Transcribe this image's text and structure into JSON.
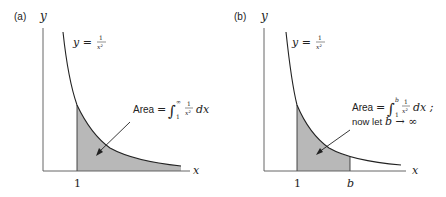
{
  "colors": {
    "stroke": "#222222",
    "shade": "#b8b8b8",
    "axis": "#444444"
  },
  "panels": [
    {
      "label": "(a)",
      "y_axis_label": "y",
      "x_axis_label": "x",
      "curve_label": {
        "lhs": "y =",
        "num": "1",
        "den": "x²"
      },
      "tick_labels": [
        "1"
      ],
      "annotation": {
        "area_word": "Area",
        "eq": "=",
        "integral": "∫",
        "upper": "∞",
        "lower": "1",
        "num": "1",
        "den": "x²",
        "dx": "dx"
      }
    },
    {
      "label": "(b)",
      "y_axis_label": "y",
      "x_axis_label": "x",
      "curve_label": {
        "lhs": "y =",
        "num": "1",
        "den": "x²"
      },
      "tick_labels": [
        "1",
        "b"
      ],
      "annotation": {
        "area_word": "Area",
        "eq": "=",
        "integral": "∫",
        "upper": "b",
        "lower": "1",
        "num": "1",
        "den": "x²",
        "dx": "dx ;",
        "line2_prefix": "now let",
        "line2_math": "b → ∞"
      }
    }
  ]
}
